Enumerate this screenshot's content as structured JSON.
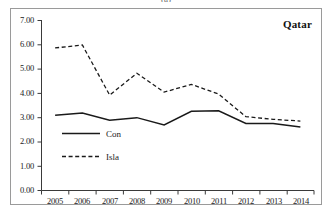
{
  "figure": {
    "panel_caption": "(a)",
    "annotation": "Qatar"
  },
  "chart_data": {
    "type": "line",
    "title": "Qatar",
    "xlabel": "",
    "ylabel": "",
    "categories": [
      "2005",
      "2006",
      "2007",
      "2008",
      "2009",
      "2010",
      "2011",
      "2012",
      "2013",
      "2014"
    ],
    "x": [
      2005,
      2006,
      2007,
      2008,
      2009,
      2010,
      2011,
      2012,
      2013,
      2014
    ],
    "ylim": [
      0.0,
      7.0
    ],
    "ytick_labels": [
      "0.00",
      "1.00",
      "2.00",
      "3.00",
      "4.00",
      "5.00",
      "6.00",
      "7.00"
    ],
    "yticks": [
      0.0,
      1.0,
      2.0,
      3.0,
      4.0,
      5.0,
      6.0,
      7.0
    ],
    "grid": false,
    "legend_position": "inside-left",
    "series": [
      {
        "name": "Con",
        "style": "solid",
        "color": "#1a1a1a",
        "values": [
          3.1,
          3.19,
          2.89,
          3.0,
          2.7,
          3.26,
          3.28,
          2.76,
          2.76,
          2.61
        ]
      },
      {
        "name": "Isla",
        "style": "dashed",
        "color": "#1a1a1a",
        "values": [
          5.87,
          5.99,
          3.93,
          4.83,
          4.05,
          4.37,
          3.97,
          3.04,
          2.93,
          2.86
        ]
      }
    ]
  },
  "legend": {
    "items": [
      {
        "label": "Con",
        "style": "solid"
      },
      {
        "label": "Isla",
        "style": "dashed"
      }
    ]
  }
}
